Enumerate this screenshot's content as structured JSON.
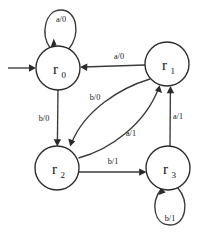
{
  "diagram": {
    "background_color": "#ffffff",
    "stroke_color": "#2b2b2b",
    "edge_color": "#3a3a3a",
    "states": [
      {
        "id": "r0",
        "label": "r",
        "subscript": "0",
        "cx": 58,
        "cy": 68,
        "r": 22,
        "is_start": true
      },
      {
        "id": "r1",
        "label": "r",
        "subscript": "1",
        "cx": 167,
        "cy": 64,
        "r": 22,
        "is_start": false
      },
      {
        "id": "r2",
        "label": "r",
        "subscript": "2",
        "cx": 57,
        "cy": 168,
        "r": 22,
        "is_start": false
      },
      {
        "id": "r3",
        "label": "r",
        "subscript": "3",
        "cx": 168,
        "cy": 168,
        "r": 22,
        "is_start": false
      }
    ],
    "start_arrow": {
      "from_x": 8,
      "to_x": 35,
      "y": 68
    },
    "transitions": [
      {
        "id": "t-r0-r0",
        "from": "r0",
        "to": "r0",
        "label": "a/0",
        "kind": "self-loop-top",
        "label_x": 61,
        "label_y": 19
      },
      {
        "id": "t-r1-r0",
        "from": "r1",
        "to": "r0",
        "label": "a/0",
        "kind": "straight-horizontal",
        "label_x": 119,
        "label_y": 59
      },
      {
        "id": "t-r0-r2",
        "from": "r0",
        "to": "r2",
        "label": "b/0",
        "kind": "straight-vertical",
        "label_x": 44,
        "label_y": 121
      },
      {
        "id": "t-r1-r2",
        "from": "r1",
        "to": "r2",
        "label": "b/0",
        "kind": "curve",
        "label_x": 95,
        "label_y": 100
      },
      {
        "id": "t-r2-r1",
        "from": "r2",
        "to": "r1",
        "label": "a/1",
        "kind": "curve",
        "label_x": 131,
        "label_y": 136
      },
      {
        "id": "t-r2-r3",
        "from": "r2",
        "to": "r3",
        "label": "b/1",
        "kind": "straight-horizontal",
        "label_x": 113,
        "label_y": 164
      },
      {
        "id": "t-r3-r1",
        "from": "r3",
        "to": "r1",
        "label": "a/1",
        "kind": "straight-vertical",
        "label_x": 177,
        "label_y": 119
      },
      {
        "id": "t-r3-r3",
        "from": "r3",
        "to": "r3",
        "label": "b/1",
        "kind": "self-loop-bottom",
        "label_x": 170,
        "label_y": 221
      }
    ]
  }
}
